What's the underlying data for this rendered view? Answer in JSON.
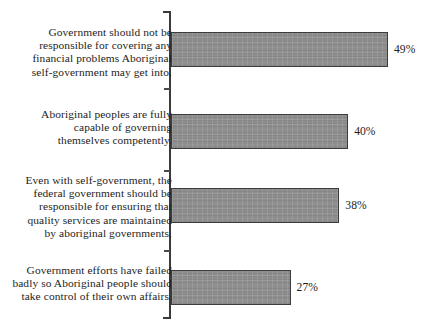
{
  "chart_data": {
    "type": "bar",
    "orientation": "horizontal",
    "title": "",
    "subtitle": "",
    "xlabel": "",
    "ylabel": "",
    "xlim": [
      0,
      55
    ],
    "grid": false,
    "legend": false,
    "value_suffix": "%",
    "categories": [
      "Government should not be\nresponsible for covering any\nfinancial problems Aboriginal\nself-government may get into.",
      "Aboriginal peoples are fully\ncapable of governing\nthemselves competently.",
      "Even with self-government, the\nfederal government should be\nresponsible for ensuring that\nquality services are maintained\nby aboriginal governments.",
      "Government efforts have failed\nbadly so Aboriginal people should\ntake control of their own affairs."
    ],
    "values": [
      49,
      40,
      38,
      27
    ],
    "value_labels": [
      "49%",
      "40%",
      "38%",
      "27%"
    ],
    "colors": {
      "bar_fill": "#8d8d8d",
      "bar_stroke": "#3c3c3c",
      "axis": "#3a3a3a",
      "text": "#1d1d1d",
      "background": "#ffffff"
    }
  },
  "geometry": {
    "axis_x": 171,
    "px_per_unit": 4.43,
    "bar_tops": [
      32,
      114,
      188,
      270
    ],
    "label_tops": [
      26,
      108,
      174,
      264
    ],
    "tick_ys": [
      88,
      170,
      250
    ]
  }
}
